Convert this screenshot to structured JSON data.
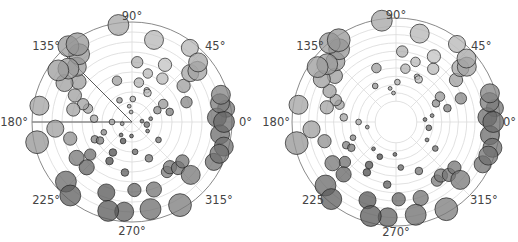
{
  "chart_data": [
    {
      "type": "scatter",
      "projection": "polar",
      "title": "",
      "center_px": [
        132,
        122
      ],
      "radius_px": 100,
      "rmax": 10,
      "rorigin": 0,
      "r_gridlines": [
        2,
        4,
        6,
        8,
        10
      ],
      "theta_tick_labels": [
        "0°",
        "45°",
        "90°",
        "135°",
        "180°",
        "225°",
        "270°",
        "315°"
      ],
      "highlight_spokes_deg": [
        135,
        180
      ],
      "colormap": "hsv (grayscale render)",
      "points": [
        {
          "theta": 0,
          "r": 9.2,
          "s": 11
        },
        {
          "theta": 3,
          "r": 8.5,
          "s": 10
        },
        {
          "theta": 8,
          "r": 9.5,
          "s": 9
        },
        {
          "theta": 12,
          "r": 9.0,
          "s": 10
        },
        {
          "theta": 17,
          "r": 9.3,
          "s": 10
        },
        {
          "theta": 352,
          "r": 8.9,
          "s": 10
        },
        {
          "theta": 345,
          "r": 9.5,
          "s": 10
        },
        {
          "theta": 340,
          "r": 9.3,
          "s": 10
        },
        {
          "theta": 334,
          "r": 9.1,
          "s": 9
        },
        {
          "theta": 5,
          "r": 1.0,
          "s": 2
        },
        {
          "theta": 350,
          "r": 1.5,
          "s": 3
        },
        {
          "theta": 25,
          "r": 2.8,
          "s": 4
        },
        {
          "theta": 30,
          "r": 3.6,
          "s": 5
        },
        {
          "theta": 35,
          "r": 6.3,
          "s": 7
        },
        {
          "theta": 40,
          "r": 7.6,
          "s": 9
        },
        {
          "theta": 38,
          "r": 8.3,
          "s": 10
        },
        {
          "theta": 42,
          "r": 8.9,
          "s": 10
        },
        {
          "theta": 52,
          "r": 9.4,
          "s": 9
        },
        {
          "theta": 55,
          "r": 5.3,
          "s": 6
        },
        {
          "theta": 60,
          "r": 6.6,
          "s": 7
        },
        {
          "theta": 62,
          "r": 3.3,
          "s": 4
        },
        {
          "theta": 65,
          "r": 3.5,
          "s": 3
        },
        {
          "theta": 72,
          "r": 5.1,
          "s": 5
        },
        {
          "theta": 75,
          "r": 8.5,
          "s": 10
        },
        {
          "theta": 80,
          "r": 4.0,
          "s": 5
        },
        {
          "theta": 85,
          "r": 6.0,
          "s": 6
        },
        {
          "theta": 88,
          "r": 2.3,
          "s": 3
        },
        {
          "theta": 95,
          "r": 1.0,
          "s": 2
        },
        {
          "theta": 98,
          "r": 9.8,
          "s": 11
        },
        {
          "theta": 110,
          "r": 4.4,
          "s": 5
        },
        {
          "theta": 120,
          "r": 2.5,
          "s": 3
        },
        {
          "theta": 125,
          "r": 9.5,
          "s": 12
        },
        {
          "theta": 128,
          "r": 8.6,
          "s": 11
        },
        {
          "theta": 130,
          "r": 9.9,
          "s": 11
        },
        {
          "theta": 135,
          "r": 7.8,
          "s": 10
        },
        {
          "theta": 140,
          "r": 8.3,
          "s": 11
        },
        {
          "theta": 143,
          "r": 6.7,
          "s": 8
        },
        {
          "theta": 145,
          "r": 9.0,
          "s": 11
        },
        {
          "theta": 150,
          "r": 7.8,
          "s": 9
        },
        {
          "theta": 155,
          "r": 6.3,
          "s": 7
        },
        {
          "theta": 160,
          "r": 5.2,
          "s": 6
        },
        {
          "theta": 163,
          "r": 4.6,
          "s": 5
        },
        {
          "theta": 168,
          "r": 6.0,
          "s": 7
        },
        {
          "theta": 170,
          "r": 9.4,
          "s": 10
        },
        {
          "theta": 175,
          "r": 3.8,
          "s": 4
        },
        {
          "theta": 180,
          "r": 2.0,
          "s": 3
        },
        {
          "theta": 185,
          "r": 7.7,
          "s": 9
        },
        {
          "theta": 190,
          "r": 1.0,
          "s": 2
        },
        {
          "theta": 192,
          "r": 9.7,
          "s": 12
        },
        {
          "theta": 195,
          "r": 6.4,
          "s": 7
        },
        {
          "theta": 200,
          "r": 3.0,
          "s": 3
        },
        {
          "theta": 205,
          "r": 4.1,
          "s": 4
        },
        {
          "theta": 210,
          "r": 3.7,
          "s": 4
        },
        {
          "theta": 213,
          "r": 6.6,
          "s": 8
        },
        {
          "theta": 218,
          "r": 5.3,
          "s": 6
        },
        {
          "theta": 222,
          "r": 8.9,
          "s": 11
        },
        {
          "theta": 225,
          "r": 6.4,
          "s": 8
        },
        {
          "theta": 230,
          "r": 9.6,
          "s": 11
        },
        {
          "theta": 238,
          "r": 3.6,
          "s": 4
        },
        {
          "theta": 240,
          "r": 4.5,
          "s": 4
        },
        {
          "theta": 245,
          "r": 2.1,
          "s": 3
        },
        {
          "theta": 250,
          "r": 7.5,
          "s": 9
        },
        {
          "theta": 255,
          "r": 9.2,
          "s": 11
        },
        {
          "theta": 262,
          "r": 5.1,
          "s": 4
        },
        {
          "theta": 265,
          "r": 9.0,
          "s": 10
        },
        {
          "theta": 268,
          "r": 1.4,
          "s": 2
        },
        {
          "theta": 272,
          "r": 6.8,
          "s": 7
        },
        {
          "theta": 276,
          "r": 3.0,
          "s": 3
        },
        {
          "theta": 282,
          "r": 8.9,
          "s": 11
        },
        {
          "theta": 288,
          "r": 7.1,
          "s": 8
        },
        {
          "theta": 295,
          "r": 4.0,
          "s": 4
        },
        {
          "theta": 300,
          "r": 9.6,
          "s": 12
        },
        {
          "theta": 305,
          "r": 6.1,
          "s": 6
        },
        {
          "theta": 310,
          "r": 5.9,
          "s": 7
        },
        {
          "theta": 315,
          "r": 6.5,
          "s": 7
        },
        {
          "theta": 318,
          "r": 7.9,
          "s": 10
        },
        {
          "theta": 322,
          "r": 6.4,
          "s": 7
        },
        {
          "theta": 326,
          "r": 3.2,
          "s": 3
        },
        {
          "theta": 330,
          "r": 1.8,
          "s": 2
        },
        {
          "theta": 20,
          "r": 5.8,
          "s": 6
        },
        {
          "theta": 15,
          "r": 3.9,
          "s": 4
        },
        {
          "theta": 10,
          "r": 1.9,
          "s": 2
        },
        {
          "theta": 100,
          "r": 1.6,
          "s": 2
        },
        {
          "theta": 230,
          "r": 1.7,
          "s": 2
        }
      ]
    },
    {
      "type": "scatter",
      "projection": "polar",
      "title": "",
      "center_px": [
        396,
        122
      ],
      "radius_px": 104,
      "rmax": 10,
      "rorigin": -2.5,
      "r_gridlines": [
        0,
        2,
        4,
        6,
        8,
        10
      ],
      "theta_tick_labels": [
        "0°",
        "45°",
        "90°",
        "135°",
        "180°",
        "225°",
        "270°",
        "315°"
      ],
      "colormap": "hsv (grayscale render)",
      "note": "same data as left plot, drawn with a hollow origin offset"
    }
  ],
  "labels": {
    "left": {
      "t0": "0°",
      "t45": "45°",
      "t90": "90°",
      "t135": "135°",
      "t180": "180°",
      "t225": "225°",
      "t270": "270°",
      "t315": "315°"
    },
    "right": {
      "t0": "0°",
      "t45": "45°",
      "t90": "90°",
      "t135": "135°",
      "t180": "180°",
      "t225": "225",
      "t270": "270°",
      "t315": "315°"
    }
  }
}
